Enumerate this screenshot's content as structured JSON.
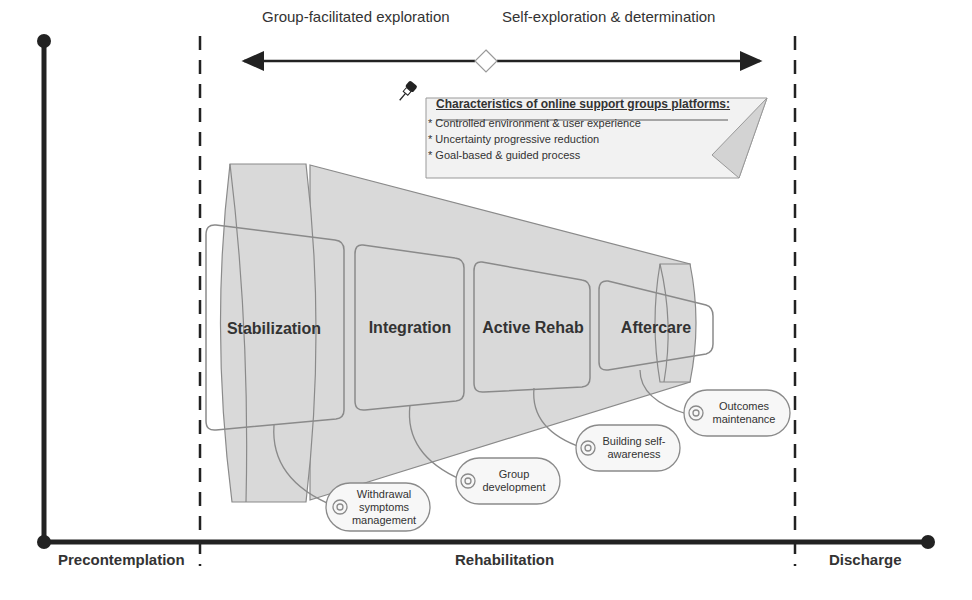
{
  "arrows": {
    "left_label": "Group-facilitated exploration",
    "right_label": "Self-exploration & determination"
  },
  "note": {
    "icon": "pushpin-icon",
    "title": "Characteristics of online support groups platforms:",
    "items": [
      "Controlled environment & user experience",
      "Uncertainty progressive reduction",
      "Goal-based & guided process"
    ]
  },
  "stages": [
    {
      "label": "Stabilization"
    },
    {
      "label": "Integration"
    },
    {
      "label": "Active Rehab"
    },
    {
      "label": "Aftercare"
    }
  ],
  "goals": [
    {
      "label": "Withdrawal\nsymptoms\nmanagement"
    },
    {
      "label": "Group\ndevelopment"
    },
    {
      "label": "Building self-\nawareness"
    },
    {
      "label": "Outcomes\nmaintenance"
    }
  ],
  "phases": [
    {
      "label": "Precontemplation"
    },
    {
      "label": "Rehabilitation"
    },
    {
      "label": "Discharge"
    }
  ],
  "colors": {
    "axis": "#222222",
    "funnel_fill": "#d9d9d9",
    "shape_stroke": "#8a8a8a",
    "note_fill": "#f2f2f2"
  }
}
